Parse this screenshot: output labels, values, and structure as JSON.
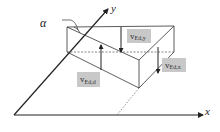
{
  "diagram": {
    "axes": {
      "x_label": "x",
      "y_label": "y"
    },
    "angle_label": "α",
    "forces": [
      {
        "id": "ved-y",
        "main": "v",
        "sub": "Ed,y",
        "direction": "down"
      },
      {
        "id": "ved-x",
        "main": "v",
        "sub": "Ed,x",
        "direction": "down"
      },
      {
        "id": "ved-d",
        "main": "v",
        "sub": "Ed,d",
        "direction": "up"
      }
    ],
    "colors": {
      "line": "#222222",
      "label_bg": "#c8c8c8",
      "dashed": "#555555"
    }
  }
}
